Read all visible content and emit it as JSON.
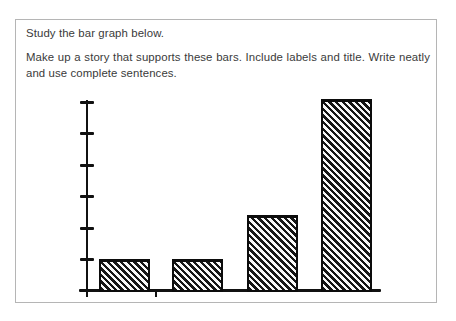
{
  "colors": {
    "background": "#ffffff",
    "panel_border": "#b5b5b5",
    "text": "#3a3a3a",
    "ink": "#111111"
  },
  "instructions": {
    "line1": "Study the bar graph below.",
    "line2a": "Make up a story that supports these bars. Include labels and title. Write neatly",
    "line2b": "and use complete sentences."
  },
  "chart_data": {
    "type": "bar",
    "title": "",
    "xlabel": "",
    "ylabel": "",
    "categories": [
      "",
      "",
      "",
      ""
    ],
    "values": [
      1,
      1,
      2.4,
      6.1
    ],
    "ylim": [
      0,
      6
    ],
    "y_ticks": [
      1,
      2,
      3,
      4,
      5,
      6
    ],
    "tick_labels_shown": false,
    "grid": false,
    "legend": false,
    "style": "hand-drawn worksheet chart; bars filled with backslash diagonal hatching; axes and ticks unlabeled"
  }
}
